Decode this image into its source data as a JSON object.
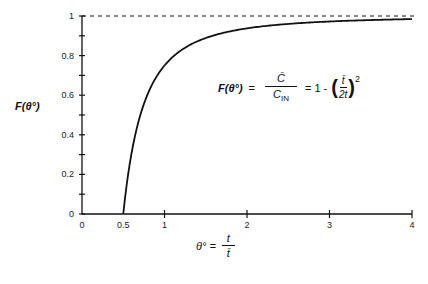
{
  "chart_data": {
    "type": "line",
    "title": "",
    "xlabel": "θ° = t / t̄",
    "ylabel": "F(θ°)",
    "xlim": [
      0,
      4
    ],
    "ylim": [
      0,
      1
    ],
    "x_ticks": [
      "0",
      "0.5",
      "1",
      "2",
      "3",
      "4"
    ],
    "y_ticks": [
      "0",
      "0.2",
      "0.4",
      "0.6",
      "0.8",
      "1"
    ],
    "grid": false,
    "legend": null,
    "series": [
      {
        "name": "F(θ°) = 1 - (1/(2θ°))²",
        "style": "solid",
        "x": [
          0.5,
          0.55,
          0.6,
          0.7,
          0.8,
          0.9,
          1.0,
          1.2,
          1.5,
          2.0,
          2.5,
          3.0,
          3.5,
          4.0
        ],
        "values": [
          0.0,
          0.174,
          0.306,
          0.49,
          0.609,
          0.691,
          0.75,
          0.826,
          0.889,
          0.9375,
          0.96,
          0.972,
          0.98,
          0.984
        ]
      },
      {
        "name": "asymptote F = 1",
        "style": "dashed",
        "x": [
          0,
          4
        ],
        "values": [
          1,
          1
        ]
      }
    ],
    "annotations": [
      "F(θ°) = C̄ / C_IN = 1 - (t̄ / 2t)²"
    ]
  },
  "labels": {
    "ylabel": "F(θ°)",
    "eq_lhs": "F(θ°)",
    "eq_eq1": "=",
    "eq_num": "C̄",
    "eq_den_c": "C",
    "eq_den_sub": "IN",
    "eq_eq2": "= 1 -",
    "eq_inner_num": "t̄",
    "eq_inner_den": "2t",
    "eq_exp": "2",
    "xlabel_theta": "θ° =",
    "xlabel_num": "t",
    "xlabel_den": "t̄",
    "caption": "Figure ..."
  }
}
